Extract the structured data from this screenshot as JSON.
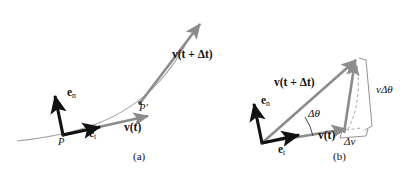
{
  "figure": {
    "panels": [
      {
        "id": "a",
        "caption": "(a)",
        "labels": {
          "e_n": "e",
          "e_n_sub": "n",
          "e_t": "e",
          "e_t_sub": "t",
          "v_t": "v",
          "v_t_arg": "(t)",
          "v_tdt": "v",
          "v_tdt_arg": "(t + Δt)",
          "point_P": "P",
          "point_Pprime": "P′"
        }
      },
      {
        "id": "b",
        "caption": "(b)",
        "labels": {
          "e_n": "e",
          "e_n_sub": "n",
          "e_t": "e",
          "e_t_sub": "t",
          "v_t": "v",
          "v_t_arg": "(t)",
          "v_tdt": "v",
          "v_tdt_arg": "(t + Δt)",
          "delta_theta": "Δθ",
          "v_delta_theta": "vΔθ",
          "delta_v": "Δv"
        }
      }
    ],
    "colors": {
      "background": "#ffffff",
      "black_vector": "#111111",
      "gray_vector": "#8c8c8c",
      "curve": "#9a9a9a",
      "dashed": "#9a9a9a",
      "bracket": "#8c8c8c",
      "text": "#111111"
    }
  }
}
